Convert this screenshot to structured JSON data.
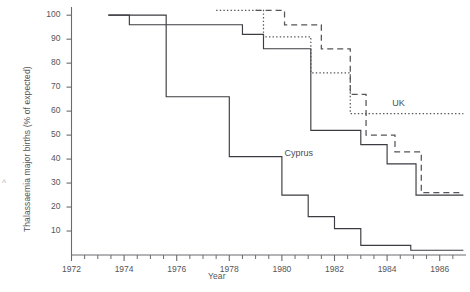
{
  "chart_data": {
    "type": "line",
    "subtype": "step",
    "title": "",
    "xlabel": "Year",
    "ylabel": "Thalassaemia major births (% of expected)",
    "xlim": [
      1972,
      1987
    ],
    "ylim": [
      0,
      103
    ],
    "xticks": [
      1972,
      1974,
      1976,
      1978,
      1980,
      1982,
      1984,
      1986
    ],
    "xtick_labels": [
      "1972",
      "1974",
      "1976",
      "1978",
      "1980",
      "1982",
      "1984",
      "1986"
    ],
    "minor_xticks": [
      1972.5,
      1973,
      1973.5,
      1974.5,
      1975,
      1975.5,
      1976.5,
      1977,
      1977.5,
      1978.5,
      1979,
      1979.5,
      1980.5,
      1981,
      1981.5,
      1982.5,
      1983,
      1983.5,
      1984.5,
      1985,
      1985.5,
      1986.5
    ],
    "yticks": [
      10,
      20,
      30,
      40,
      50,
      60,
      70,
      80,
      90,
      100
    ],
    "ytick_labels": [
      "10",
      "20",
      "30",
      "40",
      "50",
      "60",
      "70",
      "80",
      "90",
      "100"
    ],
    "grid": false,
    "legend_position": "inline-annotation",
    "annotations": [
      {
        "text": "Cyprus",
        "x": 1980.1,
        "y": 42
      },
      {
        "text": "UK",
        "x": 1984.2,
        "y": 63
      }
    ],
    "series": [
      {
        "name": "Cyprus",
        "style": "solid",
        "color": "#3c3c42",
        "x": [
          1973.4,
          1975.6,
          1975.6,
          1978.0,
          1978.0,
          1980.0,
          1980.0,
          1981.0,
          1981.0,
          1982.0,
          1982.0,
          1983.0,
          1983.0,
          1984.9,
          1984.9,
          1986.9
        ],
        "y": [
          100,
          100,
          66,
          66,
          41,
          41,
          25,
          25,
          16,
          16,
          11,
          11,
          4,
          4,
          2,
          2
        ],
        "steps": [
          {
            "x_start": 1973.4,
            "x_end": 1975.6,
            "value": 100
          },
          {
            "x_start": 1975.6,
            "x_end": 1978.0,
            "value": 66
          },
          {
            "x_start": 1978.0,
            "x_end": 1980.0,
            "value": 41
          },
          {
            "x_start": 1980.0,
            "x_end": 1981.0,
            "value": 25
          },
          {
            "x_start": 1981.0,
            "x_end": 1982.0,
            "value": 16
          },
          {
            "x_start": 1982.0,
            "x_end": 1983.0,
            "value": 11
          },
          {
            "x_start": 1983.0,
            "x_end": 1984.9,
            "value": 4
          },
          {
            "x_start": 1984.9,
            "x_end": 1986.9,
            "value": 2
          }
        ]
      },
      {
        "name": "Series 2 (solid upper)",
        "style": "solid",
        "color": "#3c3c42",
        "steps": [
          {
            "x_start": 1973.4,
            "x_end": 1974.2,
            "value": 100
          },
          {
            "x_start": 1974.2,
            "x_end": 1978.5,
            "value": 96
          },
          {
            "x_start": 1978.5,
            "x_end": 1979.3,
            "value": 92
          },
          {
            "x_start": 1979.3,
            "x_end": 1981.1,
            "value": 86
          },
          {
            "x_start": 1981.1,
            "x_end": 1983.0,
            "value": 52
          },
          {
            "x_start": 1983.0,
            "x_end": 1984.0,
            "value": 46
          },
          {
            "x_start": 1984.0,
            "x_end": 1985.1,
            "value": 38
          },
          {
            "x_start": 1985.1,
            "x_end": 1986.9,
            "value": 25
          }
        ]
      },
      {
        "name": "UK",
        "style": "dotted",
        "color": "#55555a",
        "steps": [
          {
            "x_start": 1977.5,
            "x_end": 1979.3,
            "value": 102
          },
          {
            "x_start": 1979.3,
            "x_end": 1981.1,
            "value": 91
          },
          {
            "x_start": 1981.1,
            "x_end": 1982.6,
            "value": 76
          },
          {
            "x_start": 1982.6,
            "x_end": 1986.9,
            "value": 59
          }
        ]
      },
      {
        "name": "Series 4 (dashed)",
        "style": "dashed",
        "color": "#55555a",
        "steps": [
          {
            "x_start": 1979.0,
            "x_end": 1980.1,
            "value": 102
          },
          {
            "x_start": 1980.1,
            "x_end": 1981.5,
            "value": 96
          },
          {
            "x_start": 1981.5,
            "x_end": 1982.6,
            "value": 86
          },
          {
            "x_start": 1982.6,
            "x_end": 1983.2,
            "value": 67
          },
          {
            "x_start": 1983.2,
            "x_end": 1984.3,
            "value": 50
          },
          {
            "x_start": 1984.3,
            "x_end": 1985.3,
            "value": 43
          },
          {
            "x_start": 1985.3,
            "x_end": 1986.9,
            "value": 26
          }
        ]
      }
    ]
  },
  "figure": {
    "stray_mark": "^"
  }
}
